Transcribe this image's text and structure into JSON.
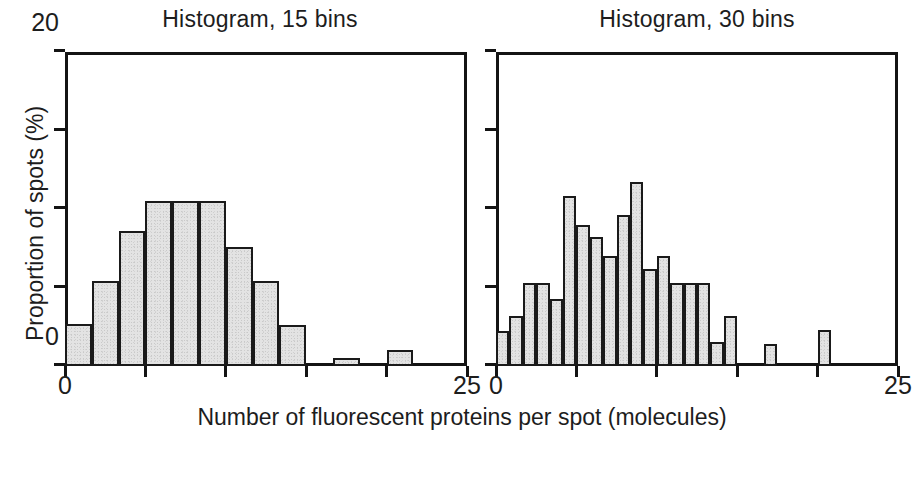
{
  "figure": {
    "xlabel": "Number of fluorescent proteins per spot (molecules)",
    "ylabel": "Proportion of spots (%)",
    "bar_fill_color": "#e3e3e3",
    "bar_edge_color": "#1a1a1a",
    "axis_color": "#141414",
    "background_color": "#ffffff"
  },
  "panels": {
    "left": {
      "title": "Histogram, 15 bins",
      "y_tick_labels": [
        "0",
        "20"
      ],
      "x_tick_labels": [
        "0",
        "25"
      ]
    },
    "right": {
      "title": "Histogram, 30 bins",
      "y_tick_labels": [],
      "x_tick_labels": [
        "0",
        "25"
      ]
    }
  },
  "chart_data": [
    {
      "type": "bar",
      "title": "Histogram, 15 bins",
      "xlabel": "Number of fluorescent proteins per spot (molecules)",
      "ylabel": "Proportion of spots (%)",
      "xlim": [
        0,
        25
      ],
      "ylim": [
        0,
        20
      ],
      "xticks": [
        0,
        5,
        10,
        15,
        20,
        25
      ],
      "yticks": [
        0,
        5,
        10,
        15,
        20
      ],
      "xtick_labels_shown": [
        "0",
        "25"
      ],
      "ytick_labels_shown": [
        "0",
        "20"
      ],
      "grid": false,
      "legend": null,
      "nbins": 15,
      "bin_width": 1.667,
      "bin_edges": [
        0,
        1.667,
        3.333,
        5.0,
        6.667,
        8.333,
        10.0,
        11.667,
        13.333,
        15.0,
        16.667,
        18.333,
        20.0,
        21.667,
        23.333,
        25.0
      ],
      "bin_centers": [
        0.83,
        2.5,
        4.17,
        5.83,
        7.5,
        9.17,
        10.83,
        12.5,
        14.17,
        15.83,
        17.5,
        19.17,
        20.83,
        22.5,
        24.17
      ],
      "values": [
        2.7,
        5.4,
        8.6,
        10.5,
        10.5,
        10.5,
        7.6,
        5.4,
        2.6,
        0.0,
        0.5,
        0.0,
        1.0,
        0.0,
        0.0
      ]
    },
    {
      "type": "bar",
      "title": "Histogram, 30 bins",
      "xlabel": "Number of fluorescent proteins per spot (molecules)",
      "ylabel": "Proportion of spots (%)",
      "xlim": [
        0,
        25
      ],
      "ylim": [
        0,
        20
      ],
      "xticks": [
        0,
        5,
        10,
        15,
        20,
        25
      ],
      "yticks": [
        0,
        5,
        10,
        15,
        20
      ],
      "xtick_labels_shown": [
        "0",
        "25"
      ],
      "ytick_labels_shown": [],
      "grid": false,
      "legend": null,
      "nbins": 30,
      "bin_width": 0.833,
      "bin_edges": [
        0,
        0.833,
        1.667,
        2.5,
        3.333,
        4.167,
        5.0,
        5.833,
        6.667,
        7.5,
        8.333,
        9.167,
        10.0,
        10.833,
        11.667,
        12.5,
        13.333,
        14.167,
        15.0,
        15.833,
        16.667,
        17.5,
        18.333,
        19.167,
        20.0,
        20.833,
        21.667,
        22.5,
        23.333,
        24.167,
        25.0
      ],
      "values": [
        2.2,
        3.2,
        5.3,
        5.3,
        4.3,
        10.8,
        9.0,
        8.2,
        7.0,
        9.6,
        11.7,
        6.2,
        7.0,
        5.3,
        5.3,
        5.3,
        1.5,
        3.2,
        0.0,
        0.0,
        1.4,
        0.0,
        0.0,
        0.0,
        2.3,
        0.0,
        0.0,
        0.0,
        0.0,
        0.0
      ]
    }
  ]
}
